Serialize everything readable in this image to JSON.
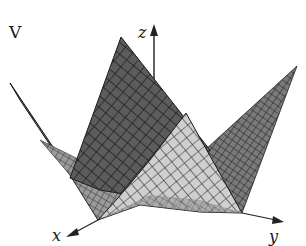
{
  "figure": {
    "title_label": "V",
    "axes": {
      "x_label": "x",
      "y_label": "y",
      "z_label": "z"
    },
    "colors": {
      "background": "#ffffff",
      "dark_surface": "#5a5a5a",
      "dark_surface_shade": "#3e3e3e",
      "light_surface": "#c8c8c8",
      "light_surface_shade": "#a8a8a8",
      "mesh_line": "#1c1c1c",
      "axis": "#222222"
    }
  }
}
